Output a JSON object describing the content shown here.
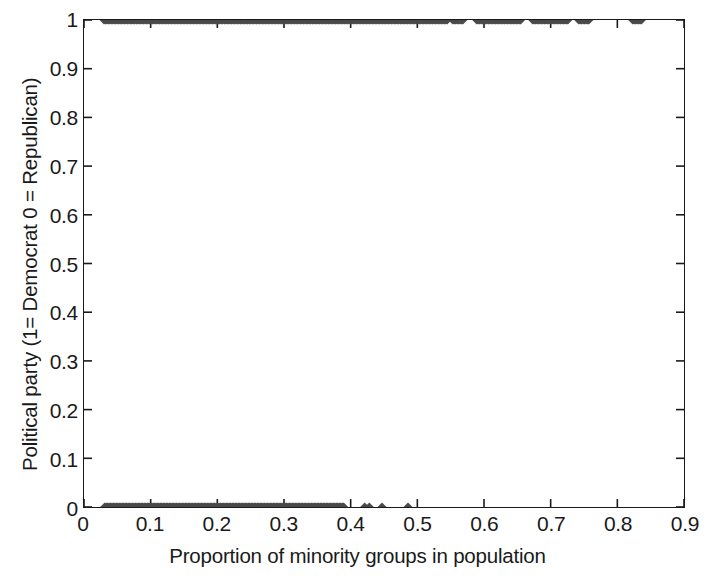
{
  "chart_data": {
    "type": "scatter",
    "title": "",
    "xlabel": "Proportion of minority groups in population",
    "ylabel": "Political party (1= Democrat 0 = Republican)",
    "xlim": [
      0,
      0.9
    ],
    "ylim": [
      0,
      1
    ],
    "grid": false,
    "legend": null,
    "marker": {
      "shape": "diamond",
      "color": "#4a4a4a",
      "size_px": 9
    },
    "xticks": [
      0,
      0.1,
      0.2,
      0.3,
      0.4,
      0.5,
      0.6,
      0.7,
      0.8,
      0.9
    ],
    "xticklabels": [
      "0",
      "0.1",
      "0.2",
      "0.3",
      "0.4",
      "0.5",
      "0.6",
      "0.7",
      "0.8",
      "0.9"
    ],
    "yticks": [
      0,
      0.1,
      0.2,
      0.3,
      0.4,
      0.5,
      0.6,
      0.7,
      0.8,
      0.9,
      1
    ],
    "yticklabels": [
      "0",
      "0.1",
      "0.2",
      "0.3",
      "0.4",
      "0.5",
      "0.6",
      "0.7",
      "0.8",
      "0.9",
      "1"
    ],
    "series": [
      {
        "name": "Democrat",
        "y": 1,
        "x_ranges": [
          [
            0.03,
            0.545
          ],
          [
            0.553,
            0.57
          ],
          [
            0.589,
            0.657
          ],
          [
            0.673,
            0.727
          ],
          [
            0.742,
            0.759
          ],
          [
            0.823,
            0.838
          ]
        ],
        "x_step": 0.0022
      },
      {
        "name": "Republican",
        "y": 0,
        "x_ranges": [
          [
            0.031,
            0.39
          ]
        ],
        "x_step": 0.0022,
        "x_points": [
          0.421,
          0.428,
          0.447,
          0.486
        ]
      }
    ]
  },
  "axes": {
    "frame_color": "#1a1a1a",
    "background": "#ffffff"
  }
}
